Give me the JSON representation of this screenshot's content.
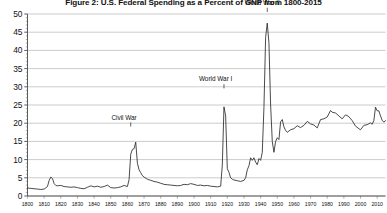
{
  "chart_data": {
    "type": "line",
    "title": "Figure 2:  U.S. Federal Spending as a Percent of GNP from 1800-2015",
    "xlabel": "",
    "ylabel": "",
    "xlim": [
      1800,
      2015
    ],
    "ylim": [
      0,
      50
    ],
    "grid": true,
    "legend": "none",
    "ytick_labels": [
      "0",
      "5",
      "10",
      "15",
      "20",
      "25",
      "30",
      "35",
      "40",
      "45",
      "50"
    ],
    "ytick_values": [
      0,
      5,
      10,
      15,
      20,
      25,
      30,
      35,
      40,
      45,
      50
    ],
    "xtick_labels": [
      "1800",
      "1810",
      "1820",
      "1830",
      "1840",
      "1850",
      "1860",
      "1870",
      "1880",
      "1890",
      "1900",
      "1910",
      "1920",
      "1930",
      "1940",
      "1950",
      "1960",
      "1970",
      "1980",
      "1990",
      "2000",
      "2010"
    ],
    "xtick_values": [
      1800,
      1810,
      1820,
      1830,
      1840,
      1850,
      1860,
      1870,
      1880,
      1890,
      1900,
      1910,
      1920,
      1930,
      1940,
      1950,
      1960,
      1970,
      1980,
      1990,
      2000,
      2010
    ],
    "annotations": [
      {
        "text": "Civil War",
        "x": 1862,
        "y": 20.5,
        "label_x": 1858,
        "label_y": 21.0
      },
      {
        "text": "World War I",
        "x": 1918,
        "y": 31.0,
        "label_x": 1913,
        "label_y": 31.5
      },
      {
        "text": "World War II",
        "x": 1944,
        "y": 52.0,
        "label_x": 1941,
        "label_y": 52.5
      }
    ],
    "series": [
      {
        "name": "U.S. Federal Spending as Percent of GNP",
        "x": [
          1800,
          1802,
          1804,
          1806,
          1808,
          1810,
          1812,
          1813,
          1814,
          1815,
          1816,
          1817,
          1818,
          1820,
          1822,
          1824,
          1826,
          1828,
          1830,
          1832,
          1834,
          1836,
          1838,
          1840,
          1842,
          1844,
          1846,
          1848,
          1850,
          1852,
          1854,
          1856,
          1858,
          1860,
          1861,
          1862,
          1863,
          1864,
          1865,
          1866,
          1867,
          1868,
          1869,
          1870,
          1872,
          1874,
          1876,
          1878,
          1880,
          1882,
          1884,
          1886,
          1888,
          1890,
          1892,
          1894,
          1896,
          1898,
          1900,
          1902,
          1904,
          1906,
          1908,
          1910,
          1912,
          1914,
          1916,
          1917,
          1918,
          1919,
          1920,
          1921,
          1922,
          1923,
          1924,
          1926,
          1928,
          1930,
          1931,
          1932,
          1933,
          1934,
          1935,
          1936,
          1937,
          1938,
          1939,
          1940,
          1941,
          1942,
          1943,
          1944,
          1945,
          1946,
          1947,
          1948,
          1949,
          1950,
          1951,
          1952,
          1953,
          1954,
          1955,
          1956,
          1958,
          1960,
          1962,
          1964,
          1966,
          1968,
          1970,
          1972,
          1974,
          1976,
          1978,
          1980,
          1982,
          1983,
          1985,
          1987,
          1989,
          1991,
          1993,
          1995,
          1997,
          1999,
          2000,
          2002,
          2004,
          2006,
          2007,
          2008,
          2009,
          2010,
          2011,
          2012,
          2013,
          2014,
          2015
        ],
        "y": [
          2.2,
          2.1,
          2.0,
          1.9,
          1.8,
          1.9,
          2.6,
          4.3,
          5.2,
          4.8,
          3.4,
          2.9,
          2.8,
          2.9,
          2.6,
          2.5,
          2.4,
          2.5,
          2.3,
          2.1,
          2.0,
          2.4,
          2.8,
          2.5,
          2.7,
          2.4,
          2.6,
          3.0,
          2.3,
          2.2,
          2.3,
          2.5,
          2.9,
          2.6,
          4.5,
          11.5,
          12.8,
          13.0,
          14.8,
          9.0,
          7.2,
          6.4,
          5.6,
          5.2,
          4.6,
          4.3,
          4.0,
          3.8,
          3.5,
          3.2,
          3.1,
          3.0,
          2.9,
          2.8,
          2.9,
          3.2,
          3.1,
          3.4,
          3.2,
          2.9,
          3.0,
          2.8,
          2.9,
          2.7,
          2.6,
          2.5,
          2.7,
          8.5,
          24.5,
          22.0,
          7.5,
          6.5,
          5.0,
          4.6,
          4.4,
          4.2,
          4.0,
          4.3,
          5.0,
          7.2,
          8.3,
          10.5,
          9.8,
          10.5,
          9.3,
          8.6,
          10.3,
          9.8,
          12.0,
          24.3,
          43.6,
          47.5,
          42.0,
          25.0,
          15.0,
          12.0,
          15.0,
          16.0,
          15.5,
          20.4,
          21.0,
          19.0,
          18.0,
          17.5,
          18.2,
          18.5,
          19.3,
          18.8,
          19.4,
          20.5,
          19.8,
          19.5,
          18.7,
          21.0,
          21.2,
          21.7,
          23.5,
          23.0,
          22.8,
          22.0,
          21.2,
          22.3,
          21.8,
          20.7,
          19.2,
          18.5,
          18.2,
          19.4,
          19.6,
          20.1,
          19.7,
          20.7,
          24.4,
          23.4,
          23.4,
          22.0,
          20.8,
          20.3,
          20.7
        ]
      }
    ]
  }
}
